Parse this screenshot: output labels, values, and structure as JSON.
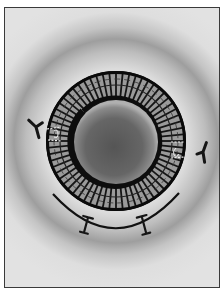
{
  "figure": {
    "description": "Grayscale illustration of a spherical particle enclosed by a spoked toroidal ring, with Y-shaped antibody molecules on either side and a curved tether with two clamp markers beneath, set in a diffuse halo background",
    "colors": {
      "background": "#e4e4e4",
      "halo_dark": "#9a9a9a",
      "ring_outline": "#111111",
      "ring_band": "#8c8c8c",
      "spoke": "#1a1a1a",
      "sphere_center": "#5a5a5a",
      "sphere_edge": "#a8a8a8",
      "frame": "#3a3a3a"
    },
    "elements": {
      "ring": {
        "cx": 115,
        "cy": 140,
        "outer_r": 70,
        "inner_r": 46,
        "spoke_count": 64
      },
      "sphere": {
        "cx": 115,
        "cy": 141,
        "r": 42
      },
      "antibody_left": {
        "x": 35,
        "y": 126,
        "rotation": -10
      },
      "antibody_right": {
        "x": 202,
        "y": 151,
        "rotation": 20
      },
      "tether_arc": {
        "start": [
          52,
          193
        ],
        "end": [
          178,
          192
        ],
        "bottom": [
          115,
          229
        ]
      },
      "clamps": [
        {
          "x": 85,
          "y": 224,
          "rotation": 15
        },
        {
          "x": 143,
          "y": 224,
          "rotation": -15
        }
      ]
    }
  }
}
